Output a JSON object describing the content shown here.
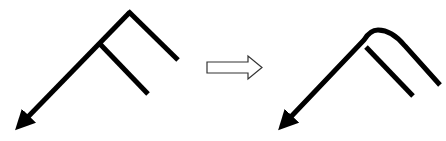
{
  "diagram": {
    "type": "before-after-transformation",
    "background": "#ffffff",
    "stroke_color": "#000000",
    "before": {
      "label": "",
      "corner_style": "sharp",
      "main_path": [
        [
          20,
          125
        ],
        [
          130,
          12
        ],
        [
          178,
          60
        ]
      ],
      "branch": [
        [
          100,
          44
        ],
        [
          148,
          94
        ]
      ],
      "arrowhead_at": [
        20,
        125
      ]
    },
    "transition_arrow": {
      "style": "outline",
      "fill": "#ffffff",
      "stroke": "#333333",
      "direction": "right"
    },
    "after": {
      "label": "",
      "corner_style": "rounded",
      "branch": [
        [
          367,
          48
        ],
        [
          413,
          96
        ]
      ],
      "arrowhead_at": [
        283,
        125
      ]
    }
  }
}
